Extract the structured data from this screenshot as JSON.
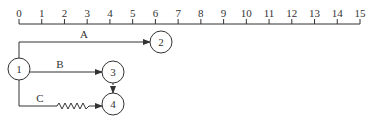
{
  "timeline": {
    "ticks": [
      "0",
      "1",
      "2",
      "3",
      "4",
      "5",
      "6",
      "7",
      "8",
      "9",
      "10",
      "11",
      "12",
      "13",
      "14",
      "15"
    ]
  },
  "nodes": [
    {
      "id": "1",
      "label": "1"
    },
    {
      "id": "2",
      "label": "2"
    },
    {
      "id": "3",
      "label": "3"
    },
    {
      "id": "4",
      "label": "4"
    }
  ],
  "edges": [
    {
      "id": "A",
      "label": "A",
      "from": "1",
      "to": "2",
      "style": "solid"
    },
    {
      "id": "B",
      "label": "B",
      "from": "1",
      "to": "3",
      "style": "solid"
    },
    {
      "id": "C",
      "label": "C",
      "from": "1",
      "to": "4",
      "style": "zigzag"
    },
    {
      "id": "D",
      "label": "",
      "from": "3",
      "to": "4",
      "style": "dummy"
    }
  ],
  "colors": {
    "line": "#333333",
    "background": "#ffffff"
  }
}
